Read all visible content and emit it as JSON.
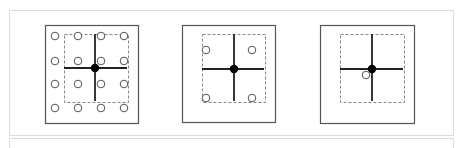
{
  "figure": {
    "width": 463,
    "height": 148,
    "frame": {
      "x": 9,
      "y": 10,
      "w": 445,
      "h": 126,
      "stroke": "#dcdcdc"
    },
    "lower_frame": {
      "x": 9,
      "y": 138,
      "w": 445,
      "h": 14,
      "stroke": "#dcdcdc"
    },
    "colors": {
      "square_stroke": "#555555",
      "dashed_stroke": "#888888",
      "cross": "#222222",
      "dot": "#000000",
      "circle_stroke": "#555555"
    },
    "panels": [
      {
        "id": "panel-1",
        "square": {
          "x": 45,
          "y": 25,
          "w": 93,
          "h": 98
        },
        "dashed": {
          "x": 64,
          "y": 34,
          "w": 64,
          "h": 68
        },
        "center": {
          "x": 95,
          "y": 68
        },
        "cross": {
          "x1": 64,
          "x2": 127,
          "y1": 34,
          "y2": 101
        },
        "circles": [
          [
            55,
            36
          ],
          [
            78,
            36
          ],
          [
            101,
            36
          ],
          [
            124,
            36
          ],
          [
            55,
            61
          ],
          [
            78,
            61
          ],
          [
            101,
            61
          ],
          [
            124,
            61
          ],
          [
            55,
            84
          ],
          [
            78,
            84
          ],
          [
            101,
            84
          ],
          [
            124,
            84
          ],
          [
            55,
            108
          ],
          [
            78,
            108
          ],
          [
            101,
            108
          ],
          [
            124,
            108
          ]
        ]
      },
      {
        "id": "panel-2",
        "square": {
          "x": 182,
          "y": 25,
          "w": 93,
          "h": 97
        },
        "dashed": {
          "x": 202,
          "y": 34,
          "w": 63,
          "h": 68
        },
        "center": {
          "x": 234,
          "y": 69
        },
        "cross": {
          "x1": 202,
          "x2": 264,
          "y1": 34,
          "y2": 101
        },
        "circles": [
          [
            206,
            50
          ],
          [
            252,
            50
          ],
          [
            206,
            98
          ],
          [
            252,
            98
          ]
        ]
      },
      {
        "id": "panel-3",
        "square": {
          "x": 320,
          "y": 25,
          "w": 94,
          "h": 98
        },
        "dashed": {
          "x": 340,
          "y": 34,
          "w": 64,
          "h": 68
        },
        "center": {
          "x": 372,
          "y": 69
        },
        "cross": {
          "x1": 340,
          "x2": 403,
          "y1": 34,
          "y2": 101
        },
        "circles": [
          [
            366,
            75
          ]
        ]
      }
    ]
  }
}
